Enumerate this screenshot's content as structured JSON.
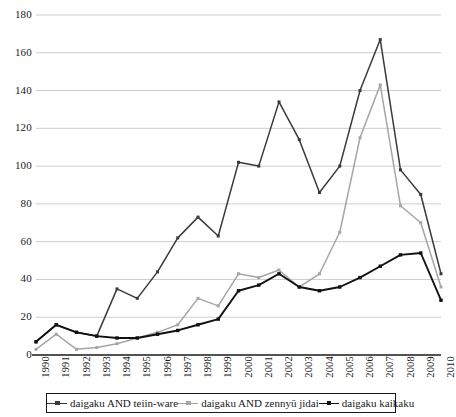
{
  "chart_data": {
    "type": "line",
    "title": "",
    "subtitle": "",
    "xlabel": "",
    "ylabel": "",
    "xlim": [
      1990,
      2010
    ],
    "ylim": [
      0,
      180
    ],
    "y_ticks": [
      0,
      20,
      40,
      60,
      80,
      100,
      120,
      140,
      160,
      180
    ],
    "grid": "horizontal",
    "legend_position": "bottom",
    "categories": [
      "1990",
      "1991",
      "1992",
      "1993",
      "1994",
      "1995",
      "1996",
      "1997",
      "1998",
      "1999",
      "2000",
      "2001",
      "2002",
      "2003",
      "2004",
      "2005",
      "2006",
      "2007",
      "2008",
      "2009",
      "2010"
    ],
    "series": [
      {
        "name": "daigaku AND teiin-ware",
        "color": "#3a3a3a",
        "marker": "square",
        "values": [
          7,
          16,
          12,
          10,
          35,
          30,
          44,
          62,
          73,
          63,
          102,
          100,
          134,
          114,
          86,
          100,
          140,
          167,
          98,
          85,
          43
        ]
      },
      {
        "name": "daigaku AND zennyū jidai",
        "color": "#a6a6a6",
        "marker": "square",
        "values": [
          3,
          11,
          3,
          4,
          6,
          9,
          12,
          16,
          30,
          26,
          43,
          41,
          45,
          36,
          43,
          65,
          115,
          143,
          79,
          70,
          36
        ]
      },
      {
        "name": "daigaku kaikaku",
        "color": "#111111",
        "marker": "square",
        "values": [
          7,
          16,
          12,
          10,
          9,
          9,
          11,
          13,
          16,
          19,
          34,
          37,
          43,
          36,
          34,
          36,
          41,
          47,
          53,
          54,
          29
        ]
      }
    ]
  },
  "axes": {
    "y_tick_labels": [
      "0",
      "20",
      "40",
      "60",
      "80",
      "100",
      "120",
      "140",
      "160",
      "180"
    ],
    "x_tick_labels": [
      "1990",
      "1991",
      "1992",
      "1993",
      "1994",
      "1995",
      "1996",
      "1997",
      "1998",
      "1999",
      "2000",
      "2001",
      "2002",
      "2003",
      "2004",
      "2005",
      "2006",
      "2007",
      "2008",
      "2009",
      "2010"
    ]
  },
  "legend": {
    "items": [
      {
        "label": "daigaku AND teiin-ware",
        "color": "#3a3a3a"
      },
      {
        "label": "daigaku AND zennyū jidai",
        "color": "#a6a6a6"
      },
      {
        "label": "daigaku kaikaku",
        "color": "#111111"
      }
    ]
  },
  "colors": {
    "axis": "#1a1a1a",
    "grid": "#cccccc",
    "background": "#ffffff"
  }
}
